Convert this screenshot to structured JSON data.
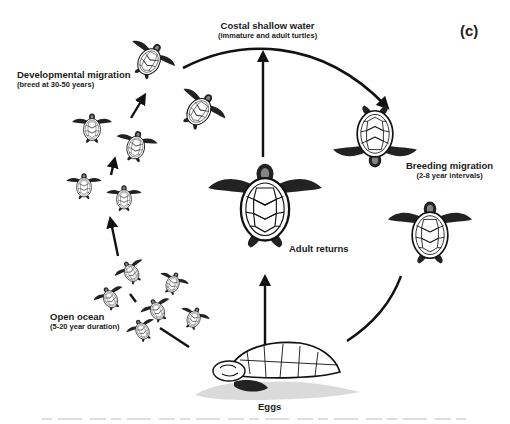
{
  "diagram": {
    "panel_label": "(c)",
    "stages": [
      {
        "id": "coastal",
        "title": "Costal shallow water",
        "subtitle": "(immature and adult turtles)"
      },
      {
        "id": "developmental",
        "title": "Developmental migration",
        "subtitle": "(breed at 30-50 years)"
      },
      {
        "id": "breeding",
        "title": "Breeding migration",
        "subtitle": "(2-8 year intervals)"
      },
      {
        "id": "adult",
        "title": "Adult returns",
        "subtitle": ""
      },
      {
        "id": "ocean",
        "title": "Open ocean",
        "subtitle": "(5-20 year duration)"
      },
      {
        "id": "eggs",
        "title": "Eggs",
        "subtitle": ""
      }
    ],
    "flows": [
      {
        "from": "eggs",
        "to": "open ocean"
      },
      {
        "from": "open ocean",
        "to": "developmental migration"
      },
      {
        "from": "developmental migration",
        "to": "coastal shallow water"
      },
      {
        "from": "coastal shallow water",
        "to": "breeding migration"
      },
      {
        "from": "breeding migration",
        "to": "eggs"
      },
      {
        "from": "eggs",
        "to": "adult returns"
      },
      {
        "from": "adult returns",
        "to": "coastal shallow water"
      }
    ],
    "caption_fragment": "Figure — sea turtle life cycle (cut off)",
    "colors": {
      "ink": "#111111",
      "background": "#ffffff"
    }
  }
}
